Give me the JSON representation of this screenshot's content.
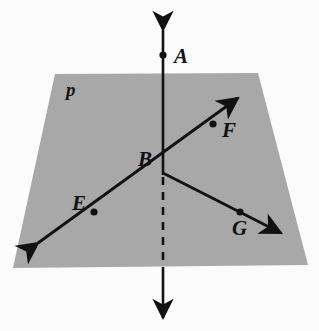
{
  "figure": {
    "width": 319,
    "height": 331,
    "background_color": "#fbfbfb",
    "plane_fill_color": "#a8a8a8",
    "ink_color": "#111111"
  },
  "plane": {
    "name": "p",
    "label": "p",
    "corners": [
      {
        "x": 55,
        "y": 74
      },
      {
        "x": 258,
        "y": 73
      },
      {
        "x": 308,
        "y": 265
      },
      {
        "x": 13,
        "y": 268
      }
    ],
    "label_position": {
      "x": 66,
      "y": 80
    }
  },
  "points": [
    {
      "id": "A",
      "label": "A",
      "x": 163,
      "y": 55,
      "dot": true,
      "label_position": {
        "x": 174,
        "y": 46
      }
    },
    {
      "id": "B",
      "label": "B",
      "x": 163,
      "y": 173,
      "dot": false,
      "label_position": {
        "x": 138,
        "y": 149
      }
    },
    {
      "id": "E",
      "label": "E",
      "x": 94,
      "y": 212,
      "dot": true,
      "label_position": {
        "x": 72,
        "y": 193
      }
    },
    {
      "id": "F",
      "label": "F",
      "x": 213,
      "y": 124,
      "dot": true,
      "label_position": {
        "x": 222,
        "y": 120
      }
    },
    {
      "id": "G",
      "label": "G",
      "x": 240,
      "y": 212,
      "dot": true,
      "label_position": {
        "x": 232,
        "y": 218
      }
    }
  ],
  "lines": [
    {
      "id": "vertical-line-AB",
      "through": [
        "A",
        "B"
      ],
      "from": {
        "x": 163,
        "y": 26
      },
      "to": {
        "x": 163,
        "y": 322
      },
      "arrow_start": true,
      "arrow_end": true,
      "dashed_segment": {
        "from": {
          "x": 163,
          "y": 175
        },
        "to": {
          "x": 163,
          "y": 268
        }
      },
      "note": "dashed where hidden behind plane p"
    },
    {
      "id": "line-EF",
      "through": [
        "E",
        "B",
        "F"
      ],
      "from": {
        "x": 33,
        "y": 246
      },
      "to": {
        "x": 242,
        "y": 94
      },
      "arrow_start": true,
      "arrow_end": true,
      "dashed_segment": null,
      "note": "line in plane through E, B and F"
    },
    {
      "id": "ray-BG",
      "through": [
        "B",
        "G"
      ],
      "from": {
        "x": 163,
        "y": 173
      },
      "to": {
        "x": 286,
        "y": 236
      },
      "arrow_start": false,
      "arrow_end": true,
      "dashed_segment": null,
      "note": "ray in plane from B through G"
    }
  ]
}
